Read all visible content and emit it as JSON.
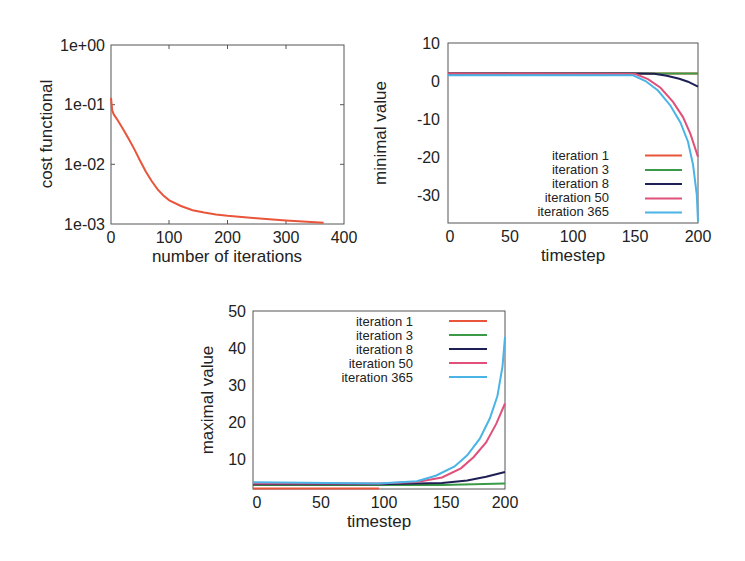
{
  "chart_data": [
    {
      "type": "line",
      "id": "cost",
      "title": "",
      "xlabel": "number of iterations",
      "ylabel": "cost functional",
      "yscale": "log",
      "xlim": [
        0,
        400
      ],
      "ylim": [
        0.001,
        1
      ],
      "xticks": [
        0,
        100,
        200,
        300,
        400
      ],
      "yticks": [
        "1e-03",
        "1e-02",
        "1e-01",
        "1e+00"
      ],
      "grid": false,
      "series": [
        {
          "name": "cost",
          "color": "#e8553a",
          "x": [
            0,
            2,
            5,
            10,
            20,
            30,
            40,
            50,
            60,
            70,
            80,
            90,
            100,
            120,
            140,
            160,
            180,
            200,
            250,
            300,
            365
          ],
          "y": [
            0.13,
            0.08,
            0.068,
            0.058,
            0.04,
            0.027,
            0.018,
            0.0115,
            0.0075,
            0.0052,
            0.0038,
            0.003,
            0.0025,
            0.002,
            0.0017,
            0.00155,
            0.00145,
            0.00138,
            0.00125,
            0.00115,
            0.00105
          ]
        }
      ]
    },
    {
      "type": "line",
      "id": "minimal",
      "title": "",
      "xlabel": "timestep",
      "ylabel": "minimal value",
      "xlim": [
        0,
        200
      ],
      "ylim": [
        -37.4,
        10
      ],
      "xticks": [
        0,
        50,
        100,
        150,
        200
      ],
      "yticks": [
        10,
        0,
        -10,
        -20,
        -30
      ],
      "grid": false,
      "legend_position": "lower right",
      "series": [
        {
          "name": "iteration 1",
          "color": "#e8553a",
          "x": [
            0,
            200
          ],
          "y": [
            2,
            2
          ]
        },
        {
          "name": "iteration 3",
          "color": "#3a9a48",
          "x": [
            0,
            150,
            200
          ],
          "y": [
            2,
            2,
            2
          ]
        },
        {
          "name": "iteration 8",
          "color": "#1e1f55",
          "x": [
            0,
            150,
            165,
            175,
            185,
            192,
            200
          ],
          "y": [
            2,
            2,
            1.9,
            1.4,
            0.6,
            -0.2,
            -1.5
          ]
        },
        {
          "name": "iteration 50",
          "color": "#e0507a",
          "x": [
            0,
            150,
            160,
            170,
            180,
            188,
            194,
            200
          ],
          "y": [
            2,
            1.8,
            0.5,
            -1.8,
            -5.5,
            -9.5,
            -14,
            -20
          ]
        },
        {
          "name": "iteration 365",
          "color": "#4ab4e6",
          "x": [
            0,
            148,
            158,
            168,
            178,
            186,
            192,
            196,
            199,
            200
          ],
          "y": [
            1.5,
            1.5,
            0,
            -2.5,
            -6.5,
            -11,
            -16,
            -22,
            -30,
            -37
          ]
        }
      ]
    },
    {
      "type": "line",
      "id": "maximal",
      "title": "",
      "xlabel": "timestep",
      "ylabel": "maximal value",
      "xlim": [
        0,
        200
      ],
      "ylim": [
        1.9,
        50
      ],
      "xticks": [
        0,
        50,
        100,
        150,
        200
      ],
      "yticks": [
        10,
        20,
        30,
        40,
        50
      ],
      "grid": false,
      "legend_position": "upper right",
      "series": [
        {
          "name": "iteration 1",
          "color": "#e8553a",
          "x": [
            0,
            100
          ],
          "y": [
            2,
            2
          ]
        },
        {
          "name": "iteration 3",
          "color": "#3a9a48",
          "x": [
            0,
            100,
            150,
            200
          ],
          "y": [
            3,
            3,
            3,
            3.4
          ]
        },
        {
          "name": "iteration 8",
          "color": "#1e1f55",
          "x": [
            0,
            100,
            150,
            170,
            185,
            200
          ],
          "y": [
            3.2,
            3.2,
            3.5,
            4.2,
            5.2,
            6.5
          ]
        },
        {
          "name": "iteration 50",
          "color": "#e0507a",
          "x": [
            0,
            100,
            130,
            150,
            165,
            175,
            185,
            193,
            200
          ],
          "y": [
            3.4,
            3.4,
            3.8,
            5,
            7.5,
            10.5,
            14.5,
            19.5,
            25
          ]
        },
        {
          "name": "iteration 365",
          "color": "#4ab4e6",
          "x": [
            0,
            100,
            130,
            145,
            160,
            170,
            180,
            188,
            194,
            198,
            200
          ],
          "y": [
            3.7,
            3.4,
            4,
            5.5,
            8,
            11,
            15.5,
            21,
            27,
            35,
            43
          ]
        }
      ]
    }
  ],
  "plots": {
    "cost": {
      "ylabel": "cost functional",
      "xlabel": "number of iterations",
      "xticks": [
        "0",
        "100",
        "200",
        "300",
        "400"
      ],
      "yticks": [
        "1e+00",
        "1e-01",
        "1e-02",
        "1e-03"
      ]
    },
    "minimal": {
      "ylabel": "minimal value",
      "xlabel": "timestep",
      "xticks": [
        "0",
        "50",
        "100",
        "150",
        "200"
      ],
      "yticks": [
        "10",
        "0",
        "-10",
        "-20",
        "-30"
      ],
      "legend": [
        "iteration 1",
        "iteration 3",
        "iteration 8",
        "iteration 50",
        "iteration 365"
      ]
    },
    "maximal": {
      "ylabel": "maximal value",
      "xlabel": "timestep",
      "xticks": [
        "0",
        "50",
        "100",
        "150",
        "200"
      ],
      "yticks": [
        "50",
        "40",
        "30",
        "20",
        "10"
      ],
      "legend": [
        "iteration 1",
        "iteration 3",
        "iteration 8",
        "iteration 50",
        "iteration 365"
      ]
    }
  }
}
